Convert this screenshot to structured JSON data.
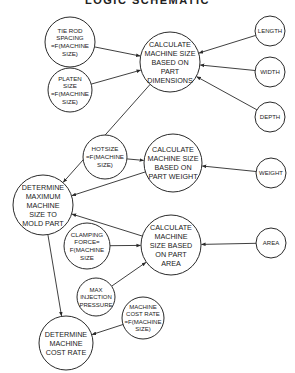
{
  "title": "LOGIC SCHEMATIC",
  "colors": {
    "stroke": "#2a2a2a",
    "text": "#1a1a1a",
    "background": "#ffffff"
  },
  "nodes": [
    {
      "id": "tie-rod-spacing",
      "cx": 70,
      "cy": 42,
      "r": 25,
      "fs": 6.2,
      "lines": [
        "TIE ROD",
        "SPACING",
        "=F(MACHINE",
        "SIZE)"
      ]
    },
    {
      "id": "platen-size",
      "cx": 70,
      "cy": 90,
      "r": 22,
      "fs": 6.2,
      "lines": [
        "PLATEN",
        "SIZE",
        "=F(MACHINE",
        "SIZE)"
      ]
    },
    {
      "id": "calc-part-dimensions",
      "cx": 170,
      "cy": 62,
      "r": 30,
      "fs": 7.2,
      "lines": [
        "CALCULATE",
        "MACHINE SIZE",
        "BASED ON",
        "PART",
        "DIMENSIONS"
      ]
    },
    {
      "id": "length",
      "cx": 270,
      "cy": 31,
      "r": 15,
      "fs": 6,
      "lines": [
        "LENGTH"
      ]
    },
    {
      "id": "width",
      "cx": 270,
      "cy": 72,
      "r": 15,
      "fs": 6,
      "lines": [
        "WIDTH"
      ]
    },
    {
      "id": "depth",
      "cx": 270,
      "cy": 117,
      "r": 15,
      "fs": 6,
      "lines": [
        "DEPTH"
      ]
    },
    {
      "id": "hotsize",
      "cx": 105,
      "cy": 157,
      "r": 22,
      "fs": 6.2,
      "lines": [
        "HOTSIZE",
        "=F(MACHINE",
        "SIZE)"
      ]
    },
    {
      "id": "calc-part-weight",
      "cx": 173,
      "cy": 163,
      "r": 29,
      "fs": 7.2,
      "lines": [
        "CALCULATE",
        "MACHINE SIZE",
        "BASED ON",
        "PART WEIGHT"
      ]
    },
    {
      "id": "weight",
      "cx": 271,
      "cy": 173,
      "r": 15,
      "fs": 6,
      "lines": [
        "WEIGHT"
      ]
    },
    {
      "id": "determine-max-size",
      "cx": 43,
      "cy": 205,
      "r": 30,
      "fs": 7.2,
      "lines": [
        "DETERMINE",
        "MAXIMUM",
        "MACHINE",
        "SIZE TO",
        "MOLD PART"
      ]
    },
    {
      "id": "clamping-force",
      "cx": 87,
      "cy": 246,
      "r": 23,
      "fs": 6.2,
      "lines": [
        "CLAMPING",
        "FORCE=",
        "F(MACHINE",
        "SIZE"
      ]
    },
    {
      "id": "calc-part-area",
      "cx": 171,
      "cy": 245,
      "r": 30,
      "fs": 7.2,
      "lines": [
        "CALCULATE",
        "MACHINE",
        "SIZE BASED",
        "ON PART",
        "AREA"
      ]
    },
    {
      "id": "area",
      "cx": 271,
      "cy": 243,
      "r": 15,
      "fs": 6,
      "lines": [
        "AREA"
      ]
    },
    {
      "id": "max-injection-pressure",
      "cx": 96,
      "cy": 297,
      "r": 19,
      "fs": 6,
      "lines": [
        "MAX",
        "INJECTION",
        "PRESSURE"
      ]
    },
    {
      "id": "machine-cost-rate-fn",
      "cx": 143,
      "cy": 318,
      "r": 21,
      "fs": 6,
      "lines": [
        "MACHINE",
        "COST RATE",
        "=F(MACHINE",
        "SIZE)"
      ]
    },
    {
      "id": "determine-cost-rate",
      "cx": 66,
      "cy": 343,
      "r": 27,
      "fs": 7.2,
      "lines": [
        "DETERMINE",
        "MACHINE",
        "COST RATE"
      ]
    }
  ],
  "edges": [
    {
      "from": "tie-rod-spacing",
      "to": "calc-part-dimensions"
    },
    {
      "from": "platen-size",
      "to": "calc-part-dimensions"
    },
    {
      "from": "length",
      "to": "calc-part-dimensions"
    },
    {
      "from": "width",
      "to": "calc-part-dimensions"
    },
    {
      "from": "depth",
      "to": "calc-part-dimensions"
    },
    {
      "from": "calc-part-dimensions",
      "to": "determine-max-size"
    },
    {
      "from": "hotsize",
      "to": "calc-part-weight"
    },
    {
      "from": "weight",
      "to": "calc-part-weight"
    },
    {
      "from": "calc-part-weight",
      "to": "determine-max-size"
    },
    {
      "from": "clamping-force",
      "to": "calc-part-area"
    },
    {
      "from": "area",
      "to": "calc-part-area"
    },
    {
      "from": "max-injection-pressure",
      "to": "calc-part-area"
    },
    {
      "from": "calc-part-area",
      "to": "determine-max-size"
    },
    {
      "from": "determine-max-size",
      "to": "determine-cost-rate"
    },
    {
      "from": "machine-cost-rate-fn",
      "to": "determine-cost-rate"
    }
  ]
}
